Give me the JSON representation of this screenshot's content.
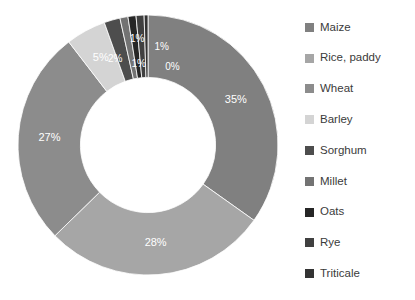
{
  "chart_data": {
    "type": "pie",
    "variant": "donut",
    "title": "",
    "subtitle": "",
    "xlabel": "",
    "ylabel": "",
    "grid": false,
    "legend_position": "right",
    "start_angle_deg": 0,
    "direction": "clockwise",
    "inner_radius_ratio": 0.52,
    "value_unit": "%",
    "categories": [
      "Maize",
      "Rice, paddy",
      "Wheat",
      "Barley",
      "Sorghum",
      "Millet",
      "Oats",
      "Rye",
      "Triticale"
    ],
    "values": [
      35,
      28,
      27,
      5,
      2,
      1,
      1,
      1,
      0
    ],
    "labels": [
      "35%",
      "28%",
      "27%",
      "5%",
      "2%",
      "1%",
      "1%",
      "1%",
      "0%"
    ],
    "colors": [
      "#808080",
      "#a6a6a6",
      "#8c8c8c",
      "#d4d4d4",
      "#4d4d4d",
      "#737373",
      "#262626",
      "#404040",
      "#333333"
    ],
    "slices": [
      {
        "name": "Maize",
        "value": 35,
        "label": "35%",
        "color": "#808080"
      },
      {
        "name": "Rice, paddy",
        "value": 28,
        "label": "28%",
        "color": "#a6a6a6"
      },
      {
        "name": "Wheat",
        "value": 27,
        "label": "27%",
        "color": "#8c8c8c"
      },
      {
        "name": "Barley",
        "value": 5,
        "label": "5%",
        "color": "#d4d4d4"
      },
      {
        "name": "Sorghum",
        "value": 2,
        "label": "2%",
        "color": "#4d4d4d"
      },
      {
        "name": "Millet",
        "value": 1,
        "label": "1%",
        "color": "#737373"
      },
      {
        "name": "Oats",
        "value": 1,
        "label": "1%",
        "color": "#262626"
      },
      {
        "name": "Rye",
        "value": 1,
        "label": "1%",
        "color": "#404040"
      },
      {
        "name": "Triticale",
        "value": 0,
        "label": "0%",
        "color": "#333333"
      }
    ]
  },
  "legend": {
    "items": [
      {
        "label": "Maize",
        "color": "#808080"
      },
      {
        "label": "Rice, paddy",
        "color": "#a6a6a6"
      },
      {
        "label": "Wheat",
        "color": "#8c8c8c"
      },
      {
        "label": "Barley",
        "color": "#d4d4d4"
      },
      {
        "label": "Sorghum",
        "color": "#4d4d4d"
      },
      {
        "label": "Millet",
        "color": "#737373"
      },
      {
        "label": "Oats",
        "color": "#262626"
      },
      {
        "label": "Rye",
        "color": "#404040"
      },
      {
        "label": "Triticale",
        "color": "#333333"
      }
    ]
  }
}
